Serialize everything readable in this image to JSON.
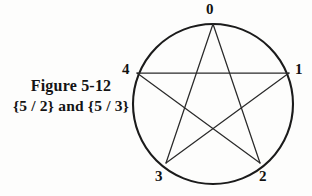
{
  "figure": {
    "caption_line1": "Figure 5-12",
    "caption_line2": "{5 / 2} and {5 / 3}",
    "background_color": "#fdfdfc",
    "ink_color": "#1b1b1b"
  },
  "diagram": {
    "type": "star-polygon",
    "shape_name": "pentagram",
    "circle": {
      "cx": 213,
      "cy": 104,
      "r": 80,
      "stroke_color": "#1b1b1b"
    },
    "vertices": [
      {
        "id": "0",
        "label": "0",
        "x": 213,
        "y": 24,
        "label_x": 206,
        "label_y": 2
      },
      {
        "id": "1",
        "label": "1",
        "x": 289,
        "y": 73,
        "label_x": 295,
        "label_y": 62
      },
      {
        "id": "2",
        "label": "2",
        "x": 260,
        "y": 163,
        "label_x": 259,
        "label_y": 169
      },
      {
        "id": "3",
        "label": "3",
        "x": 166,
        "y": 163,
        "label_x": 155,
        "label_y": 169
      },
      {
        "id": "4",
        "label": "4",
        "x": 137,
        "y": 73,
        "label_x": 122,
        "label_y": 62
      }
    ],
    "edges": [
      {
        "from": "0",
        "to": "2"
      },
      {
        "from": "2",
        "to": "4"
      },
      {
        "from": "4",
        "to": "1"
      },
      {
        "from": "1",
        "to": "3"
      },
      {
        "from": "3",
        "to": "0"
      }
    ]
  }
}
